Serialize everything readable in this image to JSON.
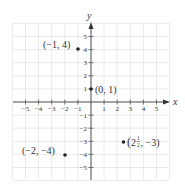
{
  "chart_data": {
    "type": "scatter",
    "title": "",
    "xlabel": "x",
    "ylabel": "y",
    "xlim": [
      -6,
      6
    ],
    "ylim": [
      -6,
      6
    ],
    "grid": true,
    "x_ticks": [
      -5,
      -4,
      -3,
      -2,
      -1,
      1,
      2,
      3,
      4,
      5
    ],
    "y_ticks": [
      5,
      4,
      3,
      2,
      1,
      -1,
      -2,
      -3,
      -4,
      -5
    ],
    "x_tick_labels": [
      "−5",
      "−4",
      "−3",
      "−2",
      "−1",
      "1",
      "2",
      "3",
      "4",
      "5"
    ],
    "y_tick_labels": [
      "5",
      "4",
      "3",
      "2",
      "1",
      "−1",
      "−2",
      "−3",
      "−4",
      "−5"
    ],
    "points": [
      {
        "x": -1,
        "y": 4,
        "label": "(−1, 4)"
      },
      {
        "x": 0,
        "y": 1,
        "label": "(0, 1)"
      },
      {
        "x": -2,
        "y": -4,
        "label": "(−2, −4)"
      },
      {
        "x": 2.5,
        "y": -3,
        "label_whole": "2",
        "label_num": "1",
        "label_den": "2",
        "label_rest": ", −3)",
        "label_open": "(",
        "label": "(2½, −3)"
      }
    ],
    "colors": {
      "grid": "#dcdcdc",
      "axis": "#555555",
      "point": "#222222",
      "text": "#333333"
    }
  }
}
